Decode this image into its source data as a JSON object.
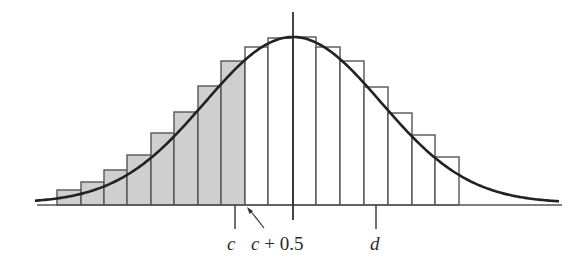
{
  "diagram": {
    "title": "",
    "colors": {
      "curve": "#222222",
      "bar_stroke": "#555555",
      "shaded_fill": "#cfcfcf",
      "unshaded_fill": "#ffffff",
      "axis": "#555555"
    },
    "labels": {
      "c": "c",
      "c_plus_half_var": "c",
      "c_plus_half_rest": " + 0.5",
      "d": "d"
    },
    "bars": [
      {
        "x0": 57,
        "x1": 81,
        "top": 190,
        "shaded": true
      },
      {
        "x0": 81,
        "x1": 104,
        "top": 182,
        "shaded": true
      },
      {
        "x0": 104,
        "x1": 127,
        "top": 170,
        "shaded": true
      },
      {
        "x0": 127,
        "x1": 151,
        "top": 155,
        "shaded": true
      },
      {
        "x0": 151,
        "x1": 174,
        "top": 133,
        "shaded": true
      },
      {
        "x0": 174,
        "x1": 198,
        "top": 112,
        "shaded": true
      },
      {
        "x0": 198,
        "x1": 221,
        "top": 86,
        "shaded": true
      },
      {
        "x0": 221,
        "x1": 245,
        "top": 61,
        "shaded": true
      },
      {
        "x0": 245,
        "x1": 268,
        "top": 47,
        "shaded": false
      },
      {
        "x0": 268,
        "x1": 293,
        "top": 38,
        "shaded": false
      },
      {
        "x0": 293,
        "x1": 316,
        "top": 37,
        "shaded": false
      },
      {
        "x0": 316,
        "x1": 340,
        "top": 47,
        "shaded": false
      },
      {
        "x0": 340,
        "x1": 364,
        "top": 61,
        "shaded": false
      },
      {
        "x0": 364,
        "x1": 388,
        "top": 87,
        "shaded": false
      },
      {
        "x0": 388,
        "x1": 412,
        "top": 113,
        "shaded": false
      },
      {
        "x0": 412,
        "x1": 435,
        "top": 135,
        "shaded": false
      },
      {
        "x0": 435,
        "x1": 459,
        "top": 157,
        "shaded": false
      }
    ],
    "baseline": {
      "x0": 37,
      "x1": 562,
      "y": 205
    },
    "center_line": {
      "x": 293,
      "y0": 12,
      "y1": 220
    },
    "ticks": {
      "c": 235,
      "d": 376
    },
    "curve": {
      "mu_x": 293,
      "sigma_px": 88,
      "base_y": 205,
      "peak_y": 37,
      "x_start": 35,
      "x_end": 560
    }
  }
}
